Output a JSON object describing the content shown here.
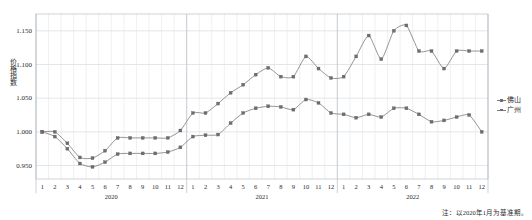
{
  "chart_data": {
    "type": "line",
    "title": "",
    "xlabel": "",
    "ylabel": "价格指数",
    "ylim": [
      0.93,
      1.175
    ],
    "yticks": [
      0.95,
      1.0,
      1.05,
      1.1,
      1.15
    ],
    "ytick_labels": [
      "0.950",
      "1.000",
      "1.050",
      "1.100",
      "1.150"
    ],
    "grid": true,
    "legend_position": "right",
    "x": [
      "2020-1",
      "2020-2",
      "2020-3",
      "2020-4",
      "2020-5",
      "2020-6",
      "2020-7",
      "2020-8",
      "2020-9",
      "2020-10",
      "2020-11",
      "2020-12",
      "2021-1",
      "2021-2",
      "2021-3",
      "2021-4",
      "2021-5",
      "2021-6",
      "2021-7",
      "2021-8",
      "2021-9",
      "2021-10",
      "2021-11",
      "2021-12",
      "2022-1",
      "2022-2",
      "2022-3",
      "2022-4",
      "2022-5",
      "2022-6",
      "2022-7",
      "2022-8",
      "2022-9",
      "2022-10",
      "2022-11",
      "2022-12"
    ],
    "xtick_labels": [
      "1",
      "2",
      "3",
      "4",
      "5",
      "6",
      "7",
      "8",
      "9",
      "10",
      "11",
      "12",
      "1",
      "2",
      "3",
      "4",
      "5",
      "6",
      "7",
      "8",
      "9",
      "10",
      "11",
      "12",
      "1",
      "2",
      "3",
      "4",
      "5",
      "6",
      "7",
      "8",
      "9",
      "10",
      "11",
      "12"
    ],
    "year_groups": [
      {
        "label": "2020",
        "start_index": 0,
        "end_index": 11
      },
      {
        "label": "2021",
        "start_index": 12,
        "end_index": 23
      },
      {
        "label": "2022",
        "start_index": 24,
        "end_index": 35
      }
    ],
    "series": [
      {
        "name": "佛山",
        "color": "#7a7a7a",
        "values": [
          1.0,
          1.0,
          0.983,
          0.962,
          0.961,
          0.972,
          0.991,
          0.991,
          0.991,
          0.991,
          0.991,
          1.002,
          1.028,
          1.028,
          1.042,
          1.058,
          1.07,
          1.085,
          1.095,
          1.082,
          1.082,
          1.112,
          1.094,
          1.08,
          1.082,
          1.112,
          1.143,
          1.108,
          1.15,
          1.158,
          1.12,
          1.12,
          1.094,
          1.12,
          1.12,
          1.12
        ]
      },
      {
        "name": "广州",
        "color": "#7a7a7a",
        "values": [
          1.0,
          0.993,
          0.975,
          0.953,
          0.948,
          0.955,
          0.967,
          0.968,
          0.968,
          0.968,
          0.97,
          0.977,
          0.993,
          0.995,
          0.996,
          1.013,
          1.028,
          1.035,
          1.038,
          1.037,
          1.033,
          1.048,
          1.043,
          1.028,
          1.026,
          1.021,
          1.026,
          1.022,
          1.035,
          1.035,
          1.026,
          1.015,
          1.017,
          1.022,
          1.025,
          1.0
        ]
      }
    ],
    "note": "注：以2020年1月为基准期。"
  },
  "legend": {
    "items": [
      {
        "label": "佛山"
      },
      {
        "label": "广州"
      }
    ]
  }
}
